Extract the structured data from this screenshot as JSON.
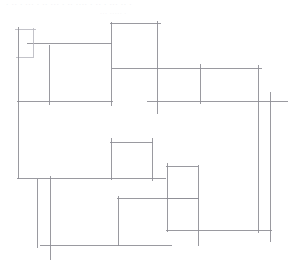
{
  "document": {
    "title": "Abstract Line Drawing",
    "width": 296,
    "height": 274,
    "background_color": "#ffffff"
  },
  "header": {
    "faint_caption": "· ··  · ··· · ··  ··· · ·· ···· · ··  · ···  ·· ·",
    "faint_subcaption": "··· ····· ·"
  },
  "style": {
    "stroke_color": "#8f8f96",
    "stroke_color_faint": "#b8b8bf",
    "stroke_color_strong": "#7d7d85",
    "stroke_width": 0.9
  },
  "drawing": {
    "type": "line-segments",
    "description": "Sparse orthogonal floor-plan-like sketch of overshooting horizontal and vertical line segments",
    "horizontal_segments": [
      {
        "name": "h-topleft-upper",
        "x1": 15,
        "x2": 36,
        "y": 29,
        "weight": "faint"
      },
      {
        "name": "h-topleft-mid",
        "x1": 27,
        "x2": 112,
        "y": 43,
        "weight": "normal"
      },
      {
        "name": "h-topleft-lower",
        "x1": 16,
        "x2": 33,
        "y": 57,
        "weight": "faint"
      },
      {
        "name": "h-centerbox-top",
        "x1": 110,
        "x2": 161,
        "y": 23,
        "weight": "normal"
      },
      {
        "name": "h-upperright-top",
        "x1": 112,
        "x2": 262,
        "y": 68,
        "weight": "normal"
      },
      {
        "name": "h-midband-left",
        "x1": 17,
        "x2": 113,
        "y": 101,
        "weight": "normal"
      },
      {
        "name": "h-midband-right",
        "x1": 147,
        "x2": 288,
        "y": 101,
        "weight": "normal"
      },
      {
        "name": "h-smallbox-top",
        "x1": 110,
        "x2": 153,
        "y": 142,
        "weight": "normal"
      },
      {
        "name": "h-smallbox-bottom",
        "x1": 17,
        "x2": 166,
        "y": 178,
        "weight": "normal"
      },
      {
        "name": "h-rightbox-top",
        "x1": 166,
        "x2": 198,
        "y": 166,
        "weight": "normal"
      },
      {
        "name": "h-rightbox-mid",
        "x1": 166,
        "x2": 199,
        "y": 198,
        "weight": "normal"
      },
      {
        "name": "h-bottombox-top",
        "x1": 117,
        "x2": 199,
        "y": 198,
        "weight": "normal"
      },
      {
        "name": "h-lowerright",
        "x1": 166,
        "x2": 272,
        "y": 230,
        "weight": "normal"
      },
      {
        "name": "h-bottom-baseline",
        "x1": 40,
        "x2": 172,
        "y": 245,
        "weight": "normal"
      }
    ],
    "vertical_segments": [
      {
        "name": "v-left-main",
        "y1": 27,
        "y2": 179,
        "x": 18,
        "weight": "normal"
      },
      {
        "name": "v-topleft-notch",
        "y1": 28,
        "y2": 58,
        "x": 33,
        "weight": "faint"
      },
      {
        "name": "v-topleft-inner",
        "y1": 45,
        "y2": 105,
        "x": 49,
        "weight": "normal"
      },
      {
        "name": "v-centerbox-left",
        "y1": 22,
        "y2": 106,
        "x": 111,
        "weight": "normal"
      },
      {
        "name": "v-centerbox-right",
        "y1": 21,
        "y2": 114,
        "x": 157,
        "weight": "normal"
      },
      {
        "name": "v-upperright-mid",
        "y1": 64,
        "y2": 104,
        "x": 200,
        "weight": "normal"
      },
      {
        "name": "v-right-outer-a",
        "y1": 65,
        "y2": 233,
        "x": 258,
        "weight": "normal"
      },
      {
        "name": "v-right-outer-b",
        "y1": 92,
        "y2": 242,
        "x": 270,
        "weight": "normal"
      },
      {
        "name": "v-smallbox-left",
        "y1": 138,
        "y2": 180,
        "x": 111,
        "weight": "normal"
      },
      {
        "name": "v-smallbox-right",
        "y1": 138,
        "y2": 181,
        "x": 152,
        "weight": "normal"
      },
      {
        "name": "v-rightbox-left",
        "y1": 163,
        "y2": 232,
        "x": 167,
        "weight": "normal"
      },
      {
        "name": "v-rightbox-right",
        "y1": 165,
        "y2": 246,
        "x": 198,
        "weight": "normal"
      },
      {
        "name": "v-bottom-left-a",
        "y1": 179,
        "y2": 248,
        "x": 37,
        "weight": "normal"
      },
      {
        "name": "v-bottom-left-b",
        "y1": 176,
        "y2": 260,
        "x": 50,
        "weight": "normal"
      },
      {
        "name": "v-bottombox-left",
        "y1": 196,
        "y2": 246,
        "x": 118,
        "weight": "normal"
      }
    ]
  }
}
